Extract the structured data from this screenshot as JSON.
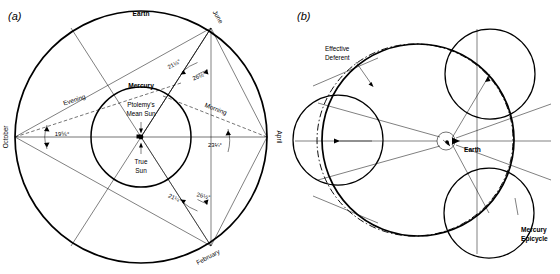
{
  "figure": {
    "panel_a": {
      "letter": "(a)",
      "labels": {
        "earth": "Earth",
        "mercury": "Mercury",
        "ptolemys_mean_sun": "Ptolemy's\nMean Sun",
        "ptolemys_mean_sun_line1": "Ptolemy's",
        "ptolemys_mean_sun_line2": "Mean Sun",
        "true_sun_line1": "True",
        "true_sun_line2": "Sun",
        "evening": "Evening",
        "morning": "Morning",
        "month_top": "June",
        "month_right": "April",
        "month_left": "October",
        "month_bottom": "February"
      },
      "angles": {
        "june_left": "21¼°",
        "june_right": "26½°",
        "february_left": "21¼°",
        "february_right": "26½°",
        "october": "19⅚°",
        "april": "23¼°"
      }
    },
    "panel_b": {
      "letter": "(b)",
      "labels": {
        "effective_deferent_line1": "Effective",
        "effective_deferent_line2": "Deferent",
        "earth": "Earth",
        "mercury_epicycle_line1": "Mercury",
        "mercury_epicycle_line2": "Epicycle"
      }
    },
    "colors": {
      "stroke": "#000000",
      "background": "#ffffff"
    }
  }
}
